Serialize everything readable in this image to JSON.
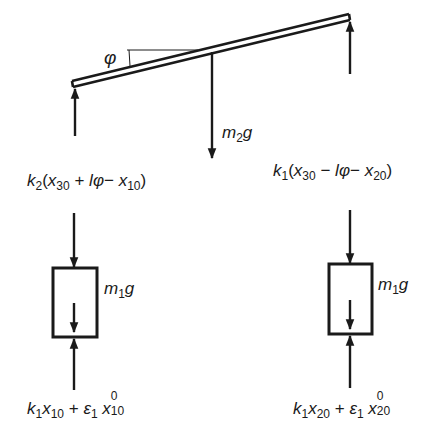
{
  "diagram": {
    "type": "free-body diagram",
    "beam": {
      "angle_label": "φ",
      "center_force": {
        "label_main": "m",
        "label_sub": "2",
        "label_tail": "g"
      }
    },
    "left_spring_force": {
      "k": "k",
      "k_sub": "2",
      "open": "(",
      "x30": "x",
      "x30_sub": "30",
      "plus": " + ",
      "l": "l",
      "phi": "φ",
      "minus": "− ",
      "x10": "x",
      "x10_sub": "10",
      "close": ")"
    },
    "right_spring_force": {
      "k": "k",
      "k_sub": "1",
      "open": "(",
      "x30": "x",
      "x30_sub": "30",
      "minus1": " − ",
      "l": "l",
      "phi": "φ",
      "minus2": "− ",
      "x20": "x",
      "x20_sub": "20",
      "close": ")"
    },
    "left_mass": {
      "label_main": "m",
      "label_sub": "1",
      "label_tail": "g"
    },
    "right_mass": {
      "label_main": "m",
      "label_sub": "1",
      "label_tail": "g"
    },
    "left_bottom_force": {
      "k": "k",
      "k_sub": "1",
      "x": "x",
      "x_sub": "10",
      "plus": " + ",
      "eps": "ε",
      "eps_sub": "1",
      "x0": "x",
      "x0_sup": "0",
      "x0_sub": "10"
    },
    "right_bottom_force": {
      "k": "k",
      "k_sub": "1",
      "x": "x",
      "x_sub": "20",
      "plus": " + ",
      "eps": "ε",
      "eps_sub": "1",
      "x0": "x",
      "x0_sup": "0",
      "x0_sub": "20"
    },
    "colors": {
      "ink": "#1a1a1a",
      "background": "#ffffff"
    }
  }
}
